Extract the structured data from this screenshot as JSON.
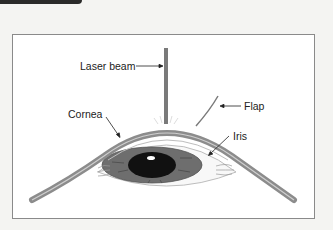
{
  "diagram": {
    "type": "anatomical-illustration",
    "labels": {
      "laser_beam": "Laser beam",
      "flap": "Flap",
      "cornea": "Cornea",
      "iris": "Iris"
    },
    "colors": {
      "background": "#f4f4f2",
      "frame_border": "#8a8a8a",
      "cornea_fill": "#8c8c8c",
      "laser": "#7a7a7a",
      "iris": "#6e6e6e",
      "pupil": "#111111",
      "header_tab": "#2a2a2a"
    }
  }
}
